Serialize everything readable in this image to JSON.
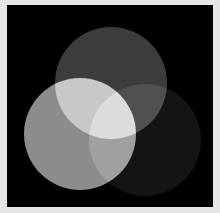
{
  "scene": {
    "description": "Three overlapping grayscale circles on a black square (additive light venn)",
    "page_background": "#e6e6e6",
    "frame_background": "#000000",
    "circles": [
      {
        "name": "top",
        "cx": 111,
        "cy": 83,
        "r": 56,
        "color": "#3c3c3c"
      },
      {
        "name": "left",
        "cx": 80,
        "cy": 134,
        "r": 56,
        "color": "#8c8c8c"
      },
      {
        "name": "right",
        "cx": 145,
        "cy": 140,
        "r": 56,
        "color": "#141414"
      }
    ]
  }
}
